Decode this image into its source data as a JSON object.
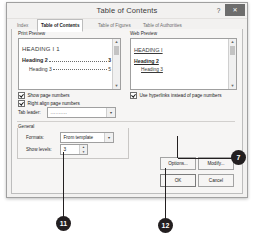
{
  "dialog": {
    "title": "Table of Contents",
    "help_icon": "?",
    "close_icon": "✕",
    "tabs": [
      {
        "label": "Index",
        "active": false
      },
      {
        "label": "Table of Contents",
        "active": true
      },
      {
        "label": "Table of Figures",
        "active": false
      },
      {
        "label": "Table of Authorities",
        "active": false
      }
    ]
  },
  "print_preview": {
    "group_label": "Print Preview",
    "scroll_up_icon": "▲",
    "scroll_down_icon": "▼",
    "lines": [
      {
        "text": "HEADING I 1",
        "level": 1,
        "page": ""
      },
      {
        "text": "Heading 2",
        "level": 2,
        "page": "3"
      },
      {
        "text": "Heading 3",
        "level": 3,
        "page": "5"
      }
    ]
  },
  "web_preview": {
    "group_label": "Web Preview",
    "scroll_up_icon": "▲",
    "scroll_down_icon": "▼",
    "lines": [
      {
        "text": "HEADING I",
        "level": 1
      },
      {
        "text": "Heading 2",
        "level": 2
      },
      {
        "text": "Heading 3",
        "level": 3
      }
    ]
  },
  "options": {
    "show_page_numbers": {
      "label": "Show page numbers",
      "checked": true
    },
    "right_align": {
      "label": "Right align page numbers",
      "checked": true
    },
    "tab_leader": {
      "label": "Tab leader:",
      "value": "..........",
      "arrow_icon": "▼"
    },
    "use_hyperlinks": {
      "label": "Use hyperlinks instead of page numbers",
      "checked": true
    }
  },
  "general": {
    "group_label": "General",
    "formats": {
      "label": "Formats:",
      "value": "From template",
      "arrow_icon": "▼"
    },
    "show_levels": {
      "label": "Show levels:",
      "value": "3",
      "up_icon": "▲",
      "down_icon": "▼"
    }
  },
  "buttons": {
    "options": "Options...",
    "modify": "Modify...",
    "ok": "OK",
    "cancel": "Cancel"
  },
  "callouts": [
    {
      "number": "7"
    },
    {
      "number": "11"
    },
    {
      "number": "12"
    }
  ]
}
